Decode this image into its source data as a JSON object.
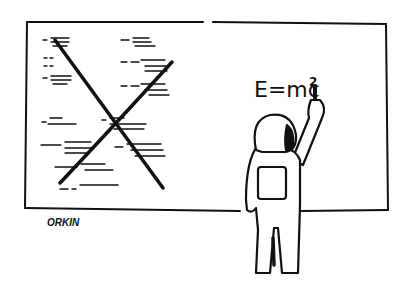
{
  "cartoon": {
    "caption_formula": "E=mc",
    "exponent": "2",
    "signature": "ORKIN",
    "ink_color": "#111111",
    "paper_color": "#ffffff",
    "crossed_equations": [
      {
        "lhs": "y'",
        "rhs": "v - vt / √(1-v²/c²)"
      },
      {
        "lhs": "y'",
        "rhs": "y"
      },
      {
        "lhs": "z'",
        "rhs": "z"
      },
      {
        "lhs": "t'",
        "rhs": "t - vx/c² / √(1-v²/c²)"
      },
      {
        "lhs": "V",
        "rhs": "v - u / 1 - uv/c²"
      },
      {
        "lhs": "w",
        "rhs": "m √(1 - v²/c²)"
      },
      {
        "lhs": "V",
        "rhs": "m √(1-v²/c²)"
      },
      {
        "lhs": "x",
        "rhs": "v - u / √(1-v²/c²)"
      },
      {
        "lhs": "x - x₀",
        "rhs": "vt - vt₀ / √(1-v²/c²)"
      },
      {
        "lhs": "v",
        "rhs": "m₀ / √(1-v²/c²)"
      },
      {
        "lhs": "L",
        "rhs": "L₀ √(1-v²/c²)"
      }
    ]
  }
}
